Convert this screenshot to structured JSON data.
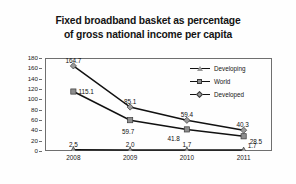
{
  "chart_data": {
    "type": "line",
    "title": "Fixed broadband basket as percentage of gross national income per capita",
    "title_lines": [
      "Fixed broadband basket as percentage",
      "of gross national income per capita"
    ],
    "xlabel": "",
    "ylabel": "",
    "categories": [
      "2008",
      "2009",
      "2010",
      "2011"
    ],
    "ylim": [
      0,
      180
    ],
    "yticks": [
      "180",
      "160",
      "140",
      "120",
      "100",
      "80",
      "60",
      "40",
      "20",
      "0"
    ],
    "ytick_values": [
      180,
      160,
      140,
      120,
      100,
      80,
      60,
      40,
      20,
      0
    ],
    "grid": false,
    "legend_position": "top-right",
    "series": [
      {
        "name": "Developing",
        "marker": "triangle",
        "color": "#9a9a9a",
        "line_color": "#111111",
        "values": [
          2.5,
          2.0,
          1.7,
          1.7
        ],
        "labels": [
          "2.5",
          "2.0",
          "1.7",
          "1.7"
        ]
      },
      {
        "name": "World",
        "marker": "square",
        "color": "#8d8d8d",
        "line_color": "#111111",
        "values": [
          115.1,
          59.7,
          41.8,
          28.5
        ],
        "labels": [
          "115.1",
          "59.7",
          "41.8",
          "28.5"
        ]
      },
      {
        "name": "Developed",
        "marker": "diamond",
        "color": "#9a9a9a",
        "line_color": "#111111",
        "values": [
          164.7,
          85.1,
          59.4,
          40.3
        ],
        "labels": [
          "164.7",
          "85.1",
          "59.4",
          "40.3"
        ]
      }
    ]
  },
  "legend": {
    "items": [
      {
        "label": "Developing"
      },
      {
        "label": "World"
      },
      {
        "label": "Developed"
      }
    ]
  },
  "colors": {
    "background": "#fefefe",
    "axis": "#6f6f6f",
    "text": "#141414",
    "line": "#111111",
    "marker_fill": "#8d8d8d"
  }
}
